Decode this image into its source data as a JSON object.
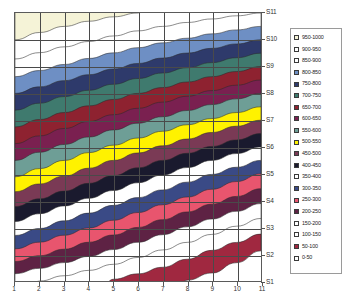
{
  "chart": {
    "type": "contour",
    "title": "",
    "xlabel": "",
    "ylabel": ""
  },
  "axes": {
    "x_ticks": [
      "1",
      "2",
      "3",
      "4",
      "5",
      "6",
      "7",
      "8",
      "9",
      "10",
      "11"
    ],
    "y_ticks": [
      "S1",
      "S2",
      "S3",
      "S4",
      "S5",
      "S6",
      "S7",
      "S8",
      "S9",
      "S10",
      "S11"
    ]
  },
  "legend": {
    "entries": [
      {
        "label": "950-1000",
        "color": "#F5F3D7"
      },
      {
        "label": "900-950",
        "color": "#FFFFFF"
      },
      {
        "label": "850-900",
        "color": "#FFFFFF"
      },
      {
        "label": "800-850",
        "color": "#6E8FC4"
      },
      {
        "label": "750-800",
        "color": "#2E3A6B"
      },
      {
        "label": "700-750",
        "color": "#3F7A6E"
      },
      {
        "label": "650-700",
        "color": "#8E2230"
      },
      {
        "label": "600-650",
        "color": "#7A2050"
      },
      {
        "label": "550-600",
        "color": "#6E9E96"
      },
      {
        "label": "500-550",
        "color": "#FFF200"
      },
      {
        "label": "450-500",
        "color": "#7A3A55"
      },
      {
        "label": "400-450",
        "color": "#1A1A2E"
      },
      {
        "label": "350-400",
        "color": "#FFFFFF"
      },
      {
        "label": "300-350",
        "color": "#3A4A86"
      },
      {
        "label": "250-300",
        "color": "#E8556E"
      },
      {
        "label": "200-250",
        "color": "#5E2244"
      },
      {
        "label": "150-200",
        "color": "#FFFFFF"
      },
      {
        "label": "100-150",
        "color": "#FFFFFF"
      },
      {
        "label": "50-100",
        "color": "#A02840"
      },
      {
        "label": "0-50",
        "color": "#FFFFFF"
      }
    ]
  },
  "chart_data": {
    "type": "heatmap",
    "title": "",
    "xlabel": "",
    "ylabel": "",
    "x": [
      1,
      2,
      3,
      4,
      5,
      6,
      7,
      8,
      9,
      10,
      11
    ],
    "y": [
      "S1",
      "S2",
      "S3",
      "S4",
      "S5",
      "S6",
      "S7",
      "S8",
      "S9",
      "S10",
      "S11"
    ],
    "zlim": [
      0,
      1000
    ],
    "contour_interval": 50,
    "grid": true,
    "legend_position": "right",
    "series": [
      {
        "name": "S11",
        "values": [
          1000,
          990,
          980,
          970,
          960,
          950,
          940,
          930,
          920,
          910,
          900
        ]
      },
      {
        "name": "S10",
        "values": [
          950,
          935,
          920,
          905,
          890,
          875,
          860,
          845,
          830,
          815,
          800
        ]
      },
      {
        "name": "S9",
        "values": [
          880,
          862,
          844,
          826,
          808,
          790,
          772,
          754,
          736,
          718,
          700
        ]
      },
      {
        "name": "S8",
        "values": [
          800,
          780,
          760,
          740,
          720,
          700,
          680,
          660,
          640,
          620,
          600
        ]
      },
      {
        "name": "S7",
        "values": [
          720,
          698,
          676,
          654,
          632,
          610,
          588,
          566,
          544,
          522,
          500
        ]
      },
      {
        "name": "S6",
        "values": [
          640,
          616,
          592,
          568,
          544,
          520,
          496,
          472,
          448,
          424,
          400
        ]
      },
      {
        "name": "S5",
        "values": [
          560,
          534,
          508,
          482,
          456,
          430,
          404,
          378,
          352,
          326,
          300
        ]
      },
      {
        "name": "S4",
        "values": [
          470,
          444,
          418,
          392,
          366,
          340,
          314,
          288,
          262,
          236,
          210
        ]
      },
      {
        "name": "S3",
        "values": [
          380,
          354,
          328,
          302,
          276,
          250,
          224,
          198,
          172,
          146,
          120
        ]
      },
      {
        "name": "S2",
        "values": [
          280,
          256,
          232,
          208,
          184,
          160,
          136,
          112,
          88,
          64,
          40
        ]
      },
      {
        "name": "S1",
        "values": [
          170,
          150,
          130,
          112,
          94,
          78,
          62,
          48,
          34,
          20,
          10
        ]
      }
    ],
    "bands": [
      {
        "range": "0-50",
        "color": "#FFFFFF"
      },
      {
        "range": "50-100",
        "color": "#A02840"
      },
      {
        "range": "100-150",
        "color": "#FFFFFF"
      },
      {
        "range": "150-200",
        "color": "#FFFFFF"
      },
      {
        "range": "200-250",
        "color": "#5E2244"
      },
      {
        "range": "250-300",
        "color": "#E8556E"
      },
      {
        "range": "300-350",
        "color": "#3A4A86"
      },
      {
        "range": "350-400",
        "color": "#FFFFFF"
      },
      {
        "range": "400-450",
        "color": "#1A1A2E"
      },
      {
        "range": "450-500",
        "color": "#7A3A55"
      },
      {
        "range": "500-550",
        "color": "#FFF200"
      },
      {
        "range": "550-600",
        "color": "#6E9E96"
      },
      {
        "range": "600-650",
        "color": "#7A2050"
      },
      {
        "range": "650-700",
        "color": "#8E2230"
      },
      {
        "range": "700-750",
        "color": "#3F7A6E"
      },
      {
        "range": "750-800",
        "color": "#2E3A6B"
      },
      {
        "range": "800-850",
        "color": "#6E8FC4"
      },
      {
        "range": "850-900",
        "color": "#FFFFFF"
      },
      {
        "range": "900-950",
        "color": "#FFFFFF"
      },
      {
        "range": "950-1000",
        "color": "#F5F3D7"
      }
    ]
  }
}
